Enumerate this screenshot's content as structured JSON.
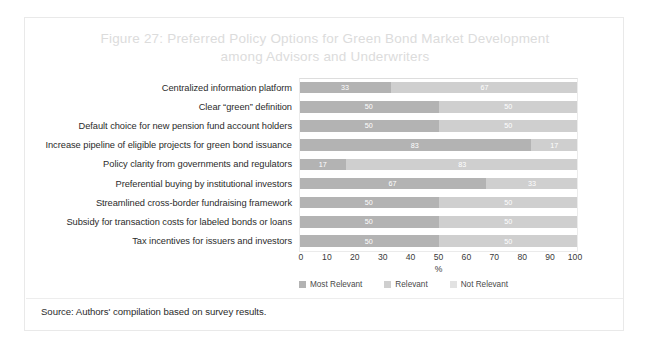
{
  "figure": {
    "title_line1": "Figure 27: Preferred Policy Options for Green Bond Market Development",
    "title_line2": "among Advisors and Underwriters",
    "source": "Source: Authors' compilation based on survey results."
  },
  "chart_data": {
    "type": "bar",
    "orientation": "horizontal",
    "stacked": true,
    "stack_mode": "percent",
    "title": "Figure 27: Preferred Policy Options for Green Bond Market Development among Advisors and Underwriters",
    "xlabel": "%",
    "ylabel": "",
    "xlim": [
      0,
      100
    ],
    "xticks": [
      0,
      10,
      20,
      30,
      40,
      50,
      60,
      70,
      80,
      90,
      100
    ],
    "grid": false,
    "legend_position": "bottom",
    "categories": [
      "Centralized information platform",
      "Clear “green” definition",
      "Default choice for new pension fund account holders",
      "Increase pipeline of eligible projects for green bond issuance",
      "Policy clarity from governments and regulators",
      "Preferential buying by institutional investors",
      "Streamlined cross-border fundraising framework",
      "Subsidy for transaction costs for labeled bonds or loans",
      "Tax incentives for issuers and investors"
    ],
    "series": [
      {
        "name": "Most Relevant",
        "color": "#b3b3b3",
        "values": [
          33,
          50,
          50,
          83,
          17,
          67,
          50,
          50,
          50
        ]
      },
      {
        "name": "Relevant",
        "color": "#cfcfcf",
        "values": [
          67,
          50,
          50,
          17,
          83,
          33,
          50,
          50,
          50
        ]
      },
      {
        "name": "Not Relevant",
        "color": "#e2e2e2",
        "values": [
          0,
          0,
          0,
          0,
          0,
          0,
          0,
          0,
          0
        ]
      }
    ],
    "bars": [
      {
        "category": "Centralized information platform",
        "segments": [
          {
            "series": "Most Relevant",
            "value": 33,
            "label": "33"
          },
          {
            "series": "Relevant",
            "value": 67,
            "label": "67"
          }
        ]
      },
      {
        "category": "Clear “green” definition",
        "segments": [
          {
            "series": "Most Relevant",
            "value": 50,
            "label": "50"
          },
          {
            "series": "Relevant",
            "value": 50,
            "label": "50"
          }
        ]
      },
      {
        "category": "Default choice for new pension fund account holders",
        "segments": [
          {
            "series": "Most Relevant",
            "value": 50,
            "label": "50"
          },
          {
            "series": "Relevant",
            "value": 50,
            "label": "50"
          }
        ]
      },
      {
        "category": "Increase pipeline of eligible projects for green bond issuance",
        "segments": [
          {
            "series": "Most Relevant",
            "value": 83,
            "label": "83"
          },
          {
            "series": "Relevant",
            "value": 17,
            "label": "17"
          }
        ]
      },
      {
        "category": "Policy clarity from governments and regulators",
        "segments": [
          {
            "series": "Most Relevant",
            "value": 17,
            "label": "17"
          },
          {
            "series": "Relevant",
            "value": 83,
            "label": "83"
          }
        ]
      },
      {
        "category": "Preferential buying by institutional investors",
        "segments": [
          {
            "series": "Most Relevant",
            "value": 67,
            "label": "67"
          },
          {
            "series": "Relevant",
            "value": 33,
            "label": "33"
          }
        ]
      },
      {
        "category": "Streamlined cross-border fundraising framework",
        "segments": [
          {
            "series": "Most Relevant",
            "value": 50,
            "label": "50"
          },
          {
            "series": "Relevant",
            "value": 50,
            "label": "50"
          }
        ]
      },
      {
        "category": "Subsidy for transaction costs for labeled bonds or loans",
        "segments": [
          {
            "series": "Most Relevant",
            "value": 50,
            "label": "50"
          },
          {
            "series": "Relevant",
            "value": 50,
            "label": "50"
          }
        ]
      },
      {
        "category": "Tax incentives for issuers and investors",
        "segments": [
          {
            "series": "Most Relevant",
            "value": 50,
            "label": "50"
          },
          {
            "series": "Relevant",
            "value": 50,
            "label": "50"
          }
        ]
      }
    ]
  }
}
